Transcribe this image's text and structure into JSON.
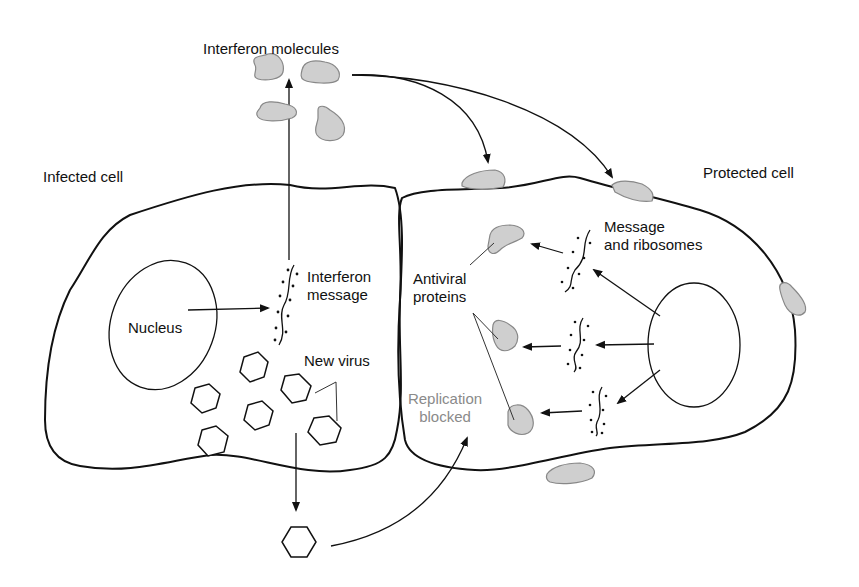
{
  "diagram": {
    "colors": {
      "line": "#111111",
      "protein_fill": "#cfcfcf",
      "protein_stroke": "#888888",
      "muted_text": "#8a8a8a"
    },
    "labels": {
      "interferon_molecules": "Interferon molecules",
      "infected_cell": "Infected cell",
      "protected_cell": "Protected cell",
      "nucleus": "Nucleus",
      "interferon_message_line1": "Interferon",
      "interferon_message_line2": "message",
      "new_virus": "New virus",
      "antiviral_line1": "Antiviral",
      "antiviral_line2": "proteins",
      "message_ribosomes_line1": "Message",
      "message_ribosomes_line2": "and ribosomes",
      "replication_line1": "Replication",
      "replication_line2": "blocked"
    },
    "nodes": [
      {
        "id": "interferon-molecules",
        "type": "protein-cluster",
        "count": 4
      },
      {
        "id": "infected-cell",
        "type": "cell"
      },
      {
        "id": "infected-nucleus",
        "type": "nucleus"
      },
      {
        "id": "interferon-message",
        "type": "mrna"
      },
      {
        "id": "new-virus",
        "type": "virus-cluster",
        "count": 7
      },
      {
        "id": "released-virus",
        "type": "virus"
      },
      {
        "id": "protected-cell",
        "type": "cell"
      },
      {
        "id": "protected-nucleus",
        "type": "nucleus"
      },
      {
        "id": "message-ribosomes",
        "type": "mrna",
        "count": 3
      },
      {
        "id": "antiviral-proteins",
        "type": "protein",
        "count": 3
      },
      {
        "id": "bound-interferon",
        "type": "protein",
        "count": 4
      }
    ],
    "edges": [
      {
        "from": "infected-nucleus",
        "to": "interferon-message"
      },
      {
        "from": "interferon-message",
        "to": "interferon-molecules"
      },
      {
        "from": "interferon-molecules",
        "to": "protected-cell"
      },
      {
        "from": "protected-nucleus",
        "to": "message-ribosomes"
      },
      {
        "from": "message-ribosomes",
        "to": "antiviral-proteins"
      },
      {
        "from": "new-virus",
        "to": "released-virus"
      },
      {
        "from": "released-virus",
        "to": "protected-cell",
        "label": "Replication blocked"
      }
    ]
  }
}
